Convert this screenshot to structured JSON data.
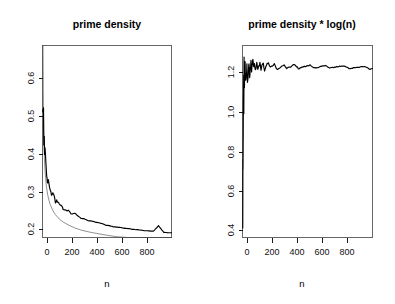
{
  "figure": {
    "width": 395,
    "height": 304,
    "background": "#ffffff",
    "foreground": "#000000",
    "panel_count": 2
  },
  "chart_data": [
    {
      "id": "prime-density",
      "type": "line",
      "title": "prime density",
      "xlabel": "n",
      "ylabel": "",
      "xlim": [
        0,
        1000
      ],
      "ylim": [
        0.155,
        0.675
      ],
      "xticks": [
        0,
        200,
        400,
        600,
        800
      ],
      "xtick_labels": [
        "0",
        "200",
        "400",
        "600",
        "800"
      ],
      "yticks": [
        0.2,
        0.3,
        0.4,
        0.5,
        0.6
      ],
      "ytick_labels": [
        "0.2",
        "0.3",
        "0.4",
        "0.5",
        "0.6"
      ],
      "grid": false,
      "legend": "none",
      "series": [
        {
          "name": "prime density",
          "style": "thick-black-jagged",
          "color": "#000000",
          "x": [
            2,
            4,
            6,
            8,
            10,
            12,
            14,
            16,
            18,
            20,
            25,
            30,
            35,
            40,
            45,
            50,
            60,
            70,
            80,
            90,
            100,
            110,
            120,
            130,
            140,
            150,
            160,
            170,
            180,
            190,
            200,
            220,
            240,
            260,
            280,
            300,
            320,
            340,
            360,
            380,
            400,
            430,
            460,
            490,
            520,
            550,
            580,
            610,
            640,
            670,
            700,
            740,
            780,
            820,
            860,
            900,
            940,
            970,
            1000
          ],
          "values": [
            0.5,
            0.5,
            0.5,
            0.5,
            0.4,
            0.417,
            0.429,
            0.375,
            0.389,
            0.4,
            0.36,
            0.333,
            0.314,
            0.3,
            0.311,
            0.3,
            0.283,
            0.271,
            0.275,
            0.267,
            0.25,
            0.255,
            0.25,
            0.246,
            0.243,
            0.24,
            0.231,
            0.229,
            0.228,
            0.226,
            0.23,
            0.218,
            0.221,
            0.219,
            0.211,
            0.207,
            0.206,
            0.203,
            0.2,
            0.2,
            0.198,
            0.195,
            0.193,
            0.188,
            0.187,
            0.184,
            0.183,
            0.182,
            0.18,
            0.179,
            0.177,
            0.176,
            0.174,
            0.173,
            0.172,
            0.187,
            0.169,
            0.168,
            0.168
          ]
        },
        {
          "name": "1 / log(n)",
          "style": "thin-smooth",
          "color": "#333333",
          "x": [
            2,
            4,
            6,
            8,
            10,
            15,
            20,
            30,
            40,
            50,
            60,
            80,
            100,
            130,
            160,
            200,
            250,
            300,
            360,
            420,
            500,
            580,
            660,
            740,
            820,
            900,
            1000
          ],
          "values": [
            1.443,
            0.721,
            0.558,
            0.481,
            0.434,
            0.369,
            0.334,
            0.294,
            0.271,
            0.256,
            0.244,
            0.228,
            0.217,
            0.205,
            0.197,
            0.189,
            0.181,
            0.175,
            0.17,
            0.166,
            0.161,
            0.157,
            0.154,
            0.151,
            0.149,
            0.147,
            0.145
          ]
        }
      ]
    },
    {
      "id": "prime-density-times-log-n",
      "type": "line",
      "title": "prime density * log(n)",
      "xlabel": "n",
      "ylabel": "",
      "xlim": [
        0,
        1000
      ],
      "ylim": [
        0.33,
        1.275
      ],
      "xticks": [
        0,
        200,
        400,
        600,
        800
      ],
      "xtick_labels": [
        "0",
        "200",
        "400",
        "600",
        "800"
      ],
      "yticks": [
        0.4,
        0.6,
        0.8,
        1.0,
        1.2
      ],
      "ytick_labels": [
        "0.4",
        "0.6",
        "0.8",
        "1.0",
        "1.2"
      ],
      "grid": false,
      "legend": "none",
      "series": [
        {
          "name": "prime density * log(n)",
          "style": "thin-black-noisy",
          "color": "#000000",
          "x": [
            2,
            3,
            4,
            5,
            6,
            7,
            8,
            9,
            10,
            12,
            14,
            16,
            18,
            20,
            23,
            26,
            30,
            34,
            38,
            42,
            46,
            50,
            55,
            60,
            65,
            70,
            75,
            80,
            86,
            92,
            98,
            104,
            110,
            118,
            126,
            134,
            142,
            150,
            160,
            170,
            180,
            190,
            200,
            215,
            230,
            245,
            260,
            280,
            300,
            320,
            340,
            360,
            380,
            400,
            430,
            460,
            490,
            520,
            550,
            580,
            610,
            640,
            670,
            700,
            740,
            780,
            820,
            860,
            900,
            940,
            980,
            1000
          ],
          "values": [
            0.347,
            0.732,
            0.693,
            0.805,
            0.896,
            0.973,
            1.04,
            1.099,
            0.921,
            1.243,
            1.056,
            1.109,
            1.156,
            1.198,
            1.098,
            1.13,
            1.134,
            1.174,
            1.09,
            1.121,
            1.15,
            1.174,
            1.122,
            1.158,
            1.19,
            1.15,
            1.177,
            1.204,
            1.162,
            1.185,
            1.147,
            1.167,
            1.186,
            1.151,
            1.17,
            1.187,
            1.157,
            1.172,
            1.186,
            1.156,
            1.169,
            1.181,
            1.192,
            1.166,
            1.176,
            1.186,
            1.157,
            1.166,
            1.175,
            1.183,
            1.16,
            1.168,
            1.175,
            1.182,
            1.162,
            1.168,
            1.174,
            1.18,
            1.163,
            1.168,
            1.173,
            1.178,
            1.163,
            1.168,
            1.172,
            1.176,
            1.161,
            1.165,
            1.169,
            1.172,
            1.158,
            1.162
          ]
        }
      ]
    }
  ],
  "panels": {
    "left": {
      "name": "prime-density-panel",
      "title": "prime density",
      "xlabel": "n",
      "xtick_labels": [
        "0",
        "200",
        "400",
        "600",
        "800"
      ],
      "ytick_labels": [
        "0.2",
        "0.3",
        "0.4",
        "0.5",
        "0.6"
      ]
    },
    "right": {
      "name": "prime-density-log-panel",
      "title": "prime density * log(n)",
      "xlabel": "n",
      "xtick_labels": [
        "0",
        "200",
        "400",
        "600",
        "800"
      ],
      "ytick_labels": [
        "0.4",
        "0.6",
        "0.8",
        "1.0",
        "1.2"
      ]
    }
  }
}
